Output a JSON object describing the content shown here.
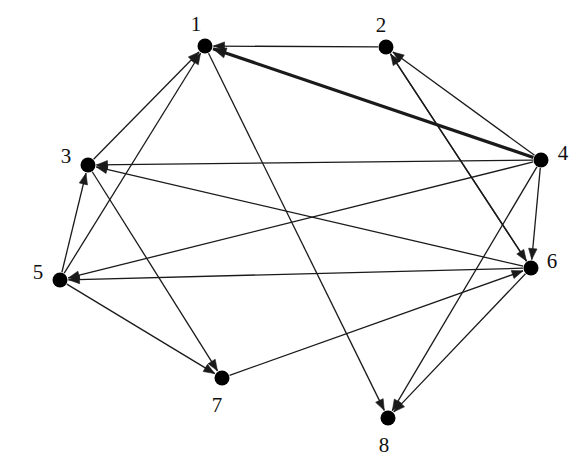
{
  "figure": {
    "title": "",
    "type": "directed-graph",
    "width": 586,
    "height": 476,
    "background_color": "#ffffff",
    "node_color": "#000000",
    "edge_color": "#1a1a1a",
    "label_color": "#101010"
  },
  "nodes": [
    {
      "id": "1",
      "label": "1",
      "x": 205,
      "y": 46,
      "r": 7.5,
      "label_x": 196,
      "label_y": 26
    },
    {
      "id": "2",
      "label": "2",
      "x": 386,
      "y": 47,
      "r": 7.5,
      "label_x": 381,
      "label_y": 27
    },
    {
      "id": "3",
      "label": "3",
      "x": 88,
      "y": 165,
      "r": 7.5,
      "label_x": 66,
      "label_y": 158
    },
    {
      "id": "4",
      "label": "4",
      "x": 541,
      "y": 160,
      "r": 7.5,
      "label_x": 563,
      "label_y": 155
    },
    {
      "id": "5",
      "label": "5",
      "x": 60,
      "y": 280,
      "r": 7.5,
      "label_x": 38,
      "label_y": 274
    },
    {
      "id": "6",
      "label": "6",
      "x": 531,
      "y": 268,
      "r": 7.5,
      "label_x": 552,
      "label_y": 263
    },
    {
      "id": "7",
      "label": "7",
      "x": 222,
      "y": 378,
      "r": 7.5,
      "label_x": 217,
      "label_y": 407
    },
    {
      "id": "8",
      "label": "8",
      "x": 388,
      "y": 418,
      "r": 7.5,
      "label_x": 384,
      "label_y": 447
    }
  ],
  "edges": [
    {
      "from": "2",
      "to": "1",
      "width": 1.3,
      "arrow": true
    },
    {
      "from": "4",
      "to": "1",
      "width": 3.2,
      "arrow": true
    },
    {
      "from": "3",
      "to": "1",
      "width": 1.3,
      "arrow": true
    },
    {
      "from": "5",
      "to": "1",
      "width": 1.3,
      "arrow": true
    },
    {
      "from": "4",
      "to": "2",
      "width": 1.3,
      "arrow": true
    },
    {
      "from": "6",
      "to": "2",
      "width": 1.3,
      "arrow": true
    },
    {
      "from": "4",
      "to": "3",
      "width": 1.3,
      "arrow": true
    },
    {
      "from": "6",
      "to": "3",
      "width": 1.3,
      "arrow": true
    },
    {
      "from": "5",
      "to": "3",
      "width": 1.3,
      "arrow": true
    },
    {
      "from": "6",
      "to": "5",
      "width": 1.3,
      "arrow": true
    },
    {
      "from": "4",
      "to": "5",
      "width": 1.3,
      "arrow": true
    },
    {
      "from": "2",
      "to": "6",
      "width": 1.3,
      "arrow": true
    },
    {
      "from": "4",
      "to": "6",
      "width": 1.3,
      "arrow": true
    },
    {
      "from": "7",
      "to": "6",
      "width": 1.3,
      "arrow": true
    },
    {
      "from": "3",
      "to": "7",
      "width": 1.3,
      "arrow": true
    },
    {
      "from": "5",
      "to": "7",
      "width": 1.3,
      "arrow": true
    },
    {
      "from": "1",
      "to": "8",
      "width": 1.3,
      "arrow": true
    },
    {
      "from": "6",
      "to": "8",
      "width": 1.3,
      "arrow": true
    },
    {
      "from": "4",
      "to": "8",
      "width": 1.3,
      "arrow": true
    }
  ],
  "chart_data": {
    "type": "graph",
    "title": "",
    "directed": true,
    "node_count": 8,
    "edge_count": 19,
    "node_ids": [
      "1",
      "2",
      "3",
      "4",
      "5",
      "6",
      "7",
      "8"
    ],
    "edge_list": [
      [
        "2",
        "1"
      ],
      [
        "4",
        "1"
      ],
      [
        "3",
        "1"
      ],
      [
        "5",
        "1"
      ],
      [
        "4",
        "2"
      ],
      [
        "6",
        "2"
      ],
      [
        "4",
        "3"
      ],
      [
        "6",
        "3"
      ],
      [
        "5",
        "3"
      ],
      [
        "6",
        "5"
      ],
      [
        "4",
        "5"
      ],
      [
        "2",
        "6"
      ],
      [
        "4",
        "6"
      ],
      [
        "7",
        "6"
      ],
      [
        "3",
        "7"
      ],
      [
        "5",
        "7"
      ],
      [
        "1",
        "8"
      ],
      [
        "6",
        "8"
      ],
      [
        "4",
        "8"
      ]
    ],
    "highlighted_edges": [
      [
        "4",
        "1"
      ]
    ],
    "layout": "circular"
  }
}
